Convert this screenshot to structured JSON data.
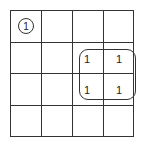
{
  "diagram": {
    "type": "karnaugh-map",
    "rows": 4,
    "cols": 4,
    "cells": [
      {
        "row": 0,
        "col": 0,
        "value": "1",
        "circled": true
      },
      {
        "row": 1,
        "col": 2,
        "value": "1",
        "circled": false
      },
      {
        "row": 1,
        "col": 3,
        "value": "1",
        "circled": false
      },
      {
        "row": 2,
        "col": 2,
        "value": "1",
        "circled": false
      },
      {
        "row": 2,
        "col": 3,
        "value": "1",
        "circled": false
      }
    ],
    "groups": [
      {
        "label": "quad-group",
        "rows": [
          1,
          2
        ],
        "cols": [
          2,
          3
        ]
      }
    ],
    "labels": {
      "c00": "1",
      "c12": "1",
      "c13": "1",
      "c22": "1",
      "c23": "1"
    }
  }
}
